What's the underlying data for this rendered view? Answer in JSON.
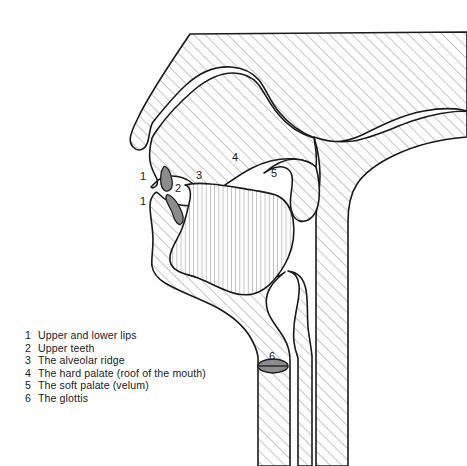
{
  "figure": {
    "background_color": "#ffffff",
    "outline_color": "#1a1a1a",
    "hatch_color": "#8d8d8d",
    "tissue_fill_color": "#ffffff",
    "teeth_fill_color": "#8c8c8c",
    "glottis_fill_color": "#8c8c8c",
    "text_color": "#1c1c1c"
  },
  "diagram_labels": [
    {
      "number": "1",
      "x": 140,
      "y": 171,
      "refers_to": "upper-lip"
    },
    {
      "number": "2",
      "x": 175,
      "y": 183,
      "refers_to": "upper-teeth"
    },
    {
      "number": "1",
      "x": 140,
      "y": 196,
      "refers_to": "lower-lip"
    },
    {
      "number": "3",
      "x": 196,
      "y": 170,
      "refers_to": "alveolar-ridge"
    },
    {
      "number": "4",
      "x": 232,
      "y": 152,
      "refers_to": "hard-palate"
    },
    {
      "number": "5",
      "x": 271,
      "y": 168,
      "refers_to": "soft-palate"
    },
    {
      "number": "6",
      "x": 269,
      "y": 351,
      "refers_to": "glottis"
    }
  ],
  "legend": {
    "items": [
      {
        "number": "1",
        "label": "Upper and lower lips"
      },
      {
        "number": "2",
        "label": "Upper teeth"
      },
      {
        "number": "3",
        "label": "The alveolar ridge"
      },
      {
        "number": "4",
        "label": "The hard palate (roof of the mouth)"
      },
      {
        "number": "5",
        "label": "The soft palate (velum)"
      },
      {
        "number": "6",
        "label": "The glottis"
      }
    ]
  }
}
